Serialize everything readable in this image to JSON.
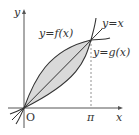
{
  "diagram": {
    "labels": {
      "y_axis": "y",
      "x_axis": "x",
      "origin": "O",
      "pi": "π",
      "f_curve": "y=f(x)",
      "line": "y=x",
      "g_curve": "y=g(x)"
    },
    "colors": {
      "curve": "#333333",
      "fill": "#d9d9d9",
      "axis": "#555555"
    }
  }
}
